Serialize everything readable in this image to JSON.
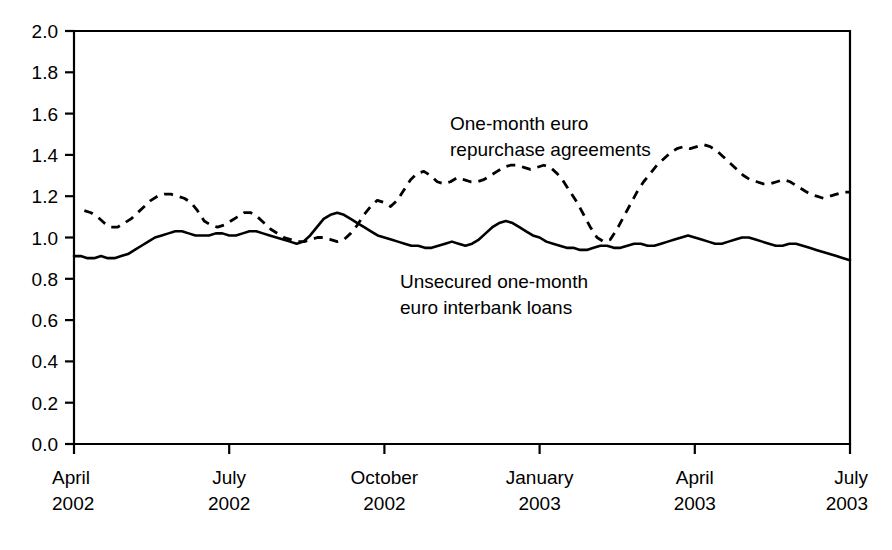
{
  "chart_data": {
    "type": "line",
    "title": "",
    "subtitle": "",
    "xlabel": "",
    "ylabel": "",
    "ylim": [
      0.0,
      2.0
    ],
    "ytick_step": 0.2,
    "grid": false,
    "legend_position": "inline-annotations",
    "yticks": [
      "0.0",
      "0.2",
      "0.4",
      "0.6",
      "0.8",
      "1.0",
      "1.2",
      "1.4",
      "1.6",
      "1.8",
      "2.0"
    ],
    "xticks": [
      {
        "month": "April",
        "year": "2002"
      },
      {
        "month": "July",
        "year": "2002"
      },
      {
        "month": "October",
        "year": "2002"
      },
      {
        "month": "January",
        "year": "2003"
      },
      {
        "month": "April",
        "year": "2003"
      },
      {
        "month": "July",
        "year": "2003"
      }
    ],
    "xlim_months": [
      0,
      15
    ],
    "annotations": [
      {
        "id": "repo-label",
        "line1": "One-month euro",
        "line2": "repurchase agreements"
      },
      {
        "id": "interbank-label",
        "line1": "Unsecured one-month",
        "line2": "euro interbank loans"
      }
    ],
    "series": [
      {
        "name": "One-month euro repurchase agreements",
        "style": "dashed",
        "color": "#000000",
        "x_start_month": 0.2,
        "values": [
          1.13,
          1.12,
          1.1,
          1.07,
          1.05,
          1.05,
          1.07,
          1.09,
          1.12,
          1.15,
          1.18,
          1.2,
          1.21,
          1.21,
          1.2,
          1.19,
          1.17,
          1.13,
          1.08,
          1.06,
          1.05,
          1.06,
          1.08,
          1.1,
          1.12,
          1.12,
          1.1,
          1.07,
          1.04,
          1.02,
          1.0,
          0.99,
          0.98,
          0.98,
          0.99,
          1.0,
          1.0,
          0.99,
          0.98,
          0.99,
          1.02,
          1.06,
          1.11,
          1.15,
          1.18,
          1.17,
          1.15,
          1.18,
          1.23,
          1.28,
          1.31,
          1.32,
          1.3,
          1.27,
          1.26,
          1.27,
          1.29,
          1.28,
          1.27,
          1.27,
          1.28,
          1.3,
          1.32,
          1.34,
          1.35,
          1.35,
          1.34,
          1.33,
          1.34,
          1.35,
          1.34,
          1.31,
          1.27,
          1.22,
          1.17,
          1.11,
          1.05,
          1.0,
          0.98,
          0.99,
          1.04,
          1.1,
          1.16,
          1.22,
          1.27,
          1.31,
          1.35,
          1.38,
          1.41,
          1.43,
          1.44,
          1.43,
          1.44,
          1.45,
          1.44,
          1.42,
          1.39,
          1.36,
          1.33,
          1.3,
          1.28,
          1.27,
          1.26,
          1.26,
          1.27,
          1.28,
          1.27,
          1.25,
          1.23,
          1.21,
          1.2,
          1.19,
          1.2,
          1.21,
          1.22,
          1.22
        ]
      },
      {
        "name": "Unsecured one-month euro interbank loans",
        "style": "solid",
        "color": "#000000",
        "x_start_month": 0.0,
        "values": [
          0.91,
          0.91,
          0.9,
          0.9,
          0.91,
          0.9,
          0.9,
          0.91,
          0.92,
          0.94,
          0.96,
          0.98,
          1.0,
          1.01,
          1.02,
          1.03,
          1.03,
          1.02,
          1.01,
          1.01,
          1.01,
          1.02,
          1.02,
          1.01,
          1.01,
          1.02,
          1.03,
          1.03,
          1.02,
          1.01,
          1.0,
          0.99,
          0.98,
          0.97,
          0.98,
          1.01,
          1.05,
          1.09,
          1.11,
          1.12,
          1.11,
          1.09,
          1.07,
          1.05,
          1.03,
          1.01,
          1.0,
          0.99,
          0.98,
          0.97,
          0.96,
          0.96,
          0.95,
          0.95,
          0.96,
          0.97,
          0.98,
          0.97,
          0.96,
          0.97,
          0.99,
          1.02,
          1.05,
          1.07,
          1.08,
          1.07,
          1.05,
          1.03,
          1.01,
          1.0,
          0.98,
          0.97,
          0.96,
          0.95,
          0.95,
          0.94,
          0.94,
          0.95,
          0.96,
          0.96,
          0.95,
          0.95,
          0.96,
          0.97,
          0.97,
          0.96,
          0.96,
          0.97,
          0.98,
          0.99,
          1.0,
          1.01,
          1.0,
          0.99,
          0.98,
          0.97,
          0.97,
          0.98,
          0.99,
          1.0,
          1.0,
          0.99,
          0.98,
          0.97,
          0.96,
          0.96,
          0.97,
          0.97,
          0.96,
          0.95,
          0.94,
          0.93,
          0.92,
          0.91,
          0.9,
          0.89
        ]
      }
    ]
  }
}
